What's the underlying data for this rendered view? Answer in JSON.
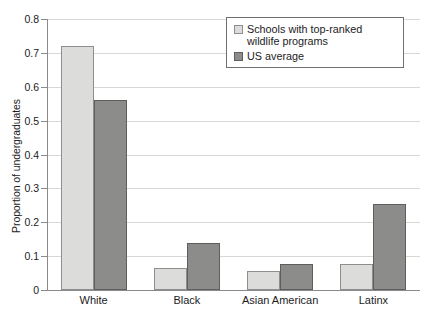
{
  "chart_data": {
    "type": "bar",
    "title": "",
    "subtitle": "",
    "xlabel": "",
    "ylabel": "Proportion of undergraduates",
    "categories": [
      "White",
      "Black",
      "Asian American",
      "Latinx"
    ],
    "series": [
      {
        "name": "Schools with top-ranked wildlife programs",
        "values": [
          0.72,
          0.065,
          0.055,
          0.078
        ],
        "color": "#dcdcda"
      },
      {
        "name": "US average",
        "values": [
          0.56,
          0.14,
          0.078,
          0.253
        ],
        "color": "#8c8c8a"
      }
    ],
    "ylim": [
      0,
      0.8
    ],
    "ytick_values": [
      0,
      0.1,
      0.2,
      0.3,
      0.4,
      0.5,
      0.6,
      0.7,
      0.8
    ],
    "ytick_labels": [
      "0",
      "0.1",
      "0.2",
      "0.3",
      "0.4",
      "0.5",
      "0.6",
      "0.7",
      "0.8"
    ],
    "grid": "horizontal",
    "legend_position": "top-right",
    "legend_entries": [
      "Schools with top-ranked wildlife programs",
      "US average"
    ]
  },
  "axis": {
    "y_title": "Proportion of undergraduates"
  },
  "legend": {
    "items": [
      {
        "label": "Schools with top-ranked wildlife programs"
      },
      {
        "label": "US average"
      }
    ]
  }
}
